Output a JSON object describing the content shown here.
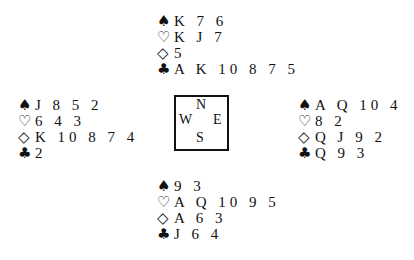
{
  "suits": {
    "spades": "♠",
    "hearts": "♡",
    "diamonds": "◇",
    "clubs": "♣"
  },
  "compass": {
    "n": "N",
    "w": "W",
    "e": "E",
    "s": "S"
  },
  "hands": {
    "north": {
      "spades": "K 7 6",
      "hearts": "K J 7",
      "diamonds": "5",
      "clubs": "A K 10 8 7 5"
    },
    "west": {
      "spades": "J 8 5 2",
      "hearts": "6 4 3",
      "diamonds": "K 10 8 7 4",
      "clubs": "2"
    },
    "east": {
      "spades": "A Q 10 4",
      "hearts": "8 2",
      "diamonds": "Q J 9 2",
      "clubs": "Q 9 3"
    },
    "south": {
      "spades": "9 3",
      "hearts": "A Q 10 9 5",
      "diamonds": "A 6 3",
      "clubs": "J 6 4"
    }
  }
}
